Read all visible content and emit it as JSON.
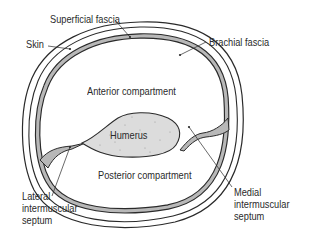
{
  "diagram": {
    "labels": {
      "superficial_fascia": "Superficial fascia",
      "skin": "Skin",
      "brachial_fascia": "Brachial fascia",
      "anterior_compartment": "Anterior compartment",
      "humerus": "Humerus",
      "posterior_compartment": "Posterior compartment",
      "lateral_septum": [
        "Lateral",
        "intermuscular",
        "septum"
      ],
      "medial_septum": [
        "Medial",
        "intermuscular",
        "septum"
      ]
    },
    "colors": {
      "line": "#2a2a2a",
      "fascia_band": "#b8b8b8",
      "bone_fill": "#dcdcdc",
      "background": "#ffffff"
    }
  }
}
